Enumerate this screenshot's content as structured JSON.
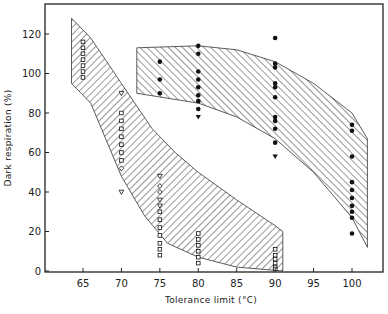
{
  "chart_data": {
    "type": "scatter",
    "title": "",
    "xlabel": "Tolerance limit (°C)",
    "ylabel": "Dark respiration (%)",
    "xlim": [
      60,
      104
    ],
    "ylim": [
      0,
      125
    ],
    "x_ticks": [
      65,
      70,
      75,
      80,
      85,
      90,
      95,
      100
    ],
    "y_ticks": [
      0,
      20,
      40,
      60,
      80,
      100,
      120
    ],
    "grid": false,
    "legend": null,
    "series": [
      {
        "name": "open squares (low tolerance group)",
        "marker": "open-square",
        "points": [
          [
            65,
            116
          ],
          [
            65,
            113
          ],
          [
            65,
            110
          ],
          [
            65,
            107
          ],
          [
            65,
            104
          ],
          [
            65,
            101
          ],
          [
            65,
            98
          ],
          [
            70,
            80
          ],
          [
            70,
            76
          ],
          [
            70,
            72
          ],
          [
            70,
            68
          ],
          [
            70,
            64
          ],
          [
            70,
            60
          ],
          [
            70,
            56
          ],
          [
            75,
            30
          ],
          [
            75,
            26
          ],
          [
            75,
            22
          ],
          [
            75,
            18
          ],
          [
            75,
            14
          ],
          [
            75,
            11
          ],
          [
            75,
            8
          ],
          [
            80,
            19
          ],
          [
            80,
            16
          ],
          [
            80,
            13
          ],
          [
            80,
            10
          ],
          [
            80,
            7
          ],
          [
            80,
            4
          ],
          [
            90,
            11
          ],
          [
            90,
            8
          ],
          [
            90,
            6
          ],
          [
            90,
            4
          ],
          [
            90,
            2
          ],
          [
            90,
            1
          ]
        ]
      },
      {
        "name": "open triangles",
        "marker": "open-triangle",
        "points": [
          [
            70,
            90
          ],
          [
            70,
            40
          ],
          [
            75,
            48
          ],
          [
            75,
            36
          ],
          [
            75,
            33
          ]
        ]
      },
      {
        "name": "open diamonds",
        "marker": "open-diamond",
        "points": [
          [
            75,
            43
          ],
          [
            75,
            40
          ],
          [
            70,
            52
          ]
        ]
      },
      {
        "name": "filled circles (high tolerance group)",
        "marker": "filled-circle",
        "points": [
          [
            75,
            106
          ],
          [
            75,
            97
          ],
          [
            75,
            90
          ],
          [
            80,
            114
          ],
          [
            80,
            110
          ],
          [
            80,
            101
          ],
          [
            80,
            97
          ],
          [
            80,
            93
          ],
          [
            80,
            89
          ],
          [
            80,
            86
          ],
          [
            80,
            82
          ],
          [
            90,
            118
          ],
          [
            90,
            105
          ],
          [
            90,
            103
          ],
          [
            90,
            95
          ],
          [
            90,
            93
          ],
          [
            90,
            88
          ],
          [
            90,
            78
          ],
          [
            90,
            76
          ],
          [
            90,
            72
          ],
          [
            90,
            65
          ],
          [
            100,
            74
          ],
          [
            100,
            71
          ],
          [
            100,
            58
          ],
          [
            100,
            45
          ],
          [
            100,
            41
          ],
          [
            100,
            37
          ],
          [
            100,
            33
          ],
          [
            100,
            30
          ],
          [
            100,
            27
          ],
          [
            100,
            19
          ]
        ]
      },
      {
        "name": "filled triangles",
        "marker": "filled-triangle",
        "points": [
          [
            80,
            78
          ],
          [
            90,
            58
          ]
        ]
      }
    ],
    "bands": [
      {
        "name": "low tolerance band (hatched, / direction)",
        "upper": [
          [
            63.5,
            128
          ],
          [
            66,
            118
          ],
          [
            70,
            95
          ],
          [
            74,
            72
          ],
          [
            77,
            60
          ],
          [
            80,
            50
          ],
          [
            85,
            36
          ],
          [
            90,
            23
          ],
          [
            91,
            20
          ]
        ],
        "lower": [
          [
            63.5,
            95
          ],
          [
            66,
            85
          ],
          [
            70,
            48
          ],
          [
            73,
            28
          ],
          [
            76,
            14
          ],
          [
            80,
            7
          ],
          [
            85,
            2
          ],
          [
            91,
            0
          ]
        ]
      },
      {
        "name": "high tolerance band (hatched, \\ direction)",
        "upper": [
          [
            72,
            113
          ],
          [
            80,
            114
          ],
          [
            85,
            112
          ],
          [
            90,
            106
          ],
          [
            95,
            95
          ],
          [
            100,
            80
          ],
          [
            102,
            67
          ]
        ],
        "lower": [
          [
            72,
            90
          ],
          [
            80,
            85
          ],
          [
            85,
            78
          ],
          [
            90,
            67
          ],
          [
            95,
            50
          ],
          [
            100,
            27
          ],
          [
            102,
            12
          ]
        ]
      }
    ]
  },
  "axes": {
    "x_label": "Tolerance limit (°C)",
    "y_label": "Dark respiration (%)",
    "x_tick_labels": [
      "65",
      "70",
      "75",
      "80",
      "85",
      "90",
      "95",
      "100"
    ],
    "y_tick_labels": [
      "0",
      "20",
      "40",
      "60",
      "80",
      "100",
      "120"
    ]
  }
}
